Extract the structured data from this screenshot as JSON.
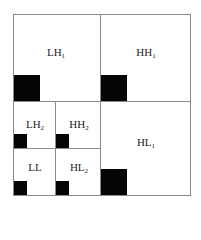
{
  "diagram": {
    "title": "",
    "subbands": [
      {
        "id": "LH1",
        "base": "LH",
        "sub": "1"
      },
      {
        "id": "HH1",
        "base": "HH",
        "sub": "1"
      },
      {
        "id": "HL1",
        "base": "HL",
        "sub": "1"
      },
      {
        "id": "LH2",
        "base": "LH",
        "sub": "2"
      },
      {
        "id": "HH2",
        "base": "HH",
        "sub": "2"
      },
      {
        "id": "LL",
        "base": "LL",
        "sub": ""
      },
      {
        "id": "HL2",
        "base": "HL",
        "sub": "2"
      }
    ],
    "colors": {
      "border": "#8a8a8a",
      "block": "#050505",
      "background": "#ffffff"
    }
  }
}
